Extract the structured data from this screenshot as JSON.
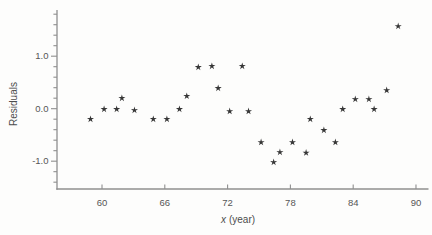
{
  "labels": {
    "xlabel_var": "x",
    "xlabel_rest": "(year)"
  },
  "chart_data": {
    "type": "scatter",
    "title": "",
    "xlabel": "x (year)",
    "ylabel": "Residuals",
    "marker": "asterisk-star",
    "marker_color": "#363636",
    "axis_color": "#8f8f8f",
    "grid": false,
    "legend": false,
    "xlim": [
      55.7,
      91.1
    ],
    "ylim": [
      -1.53,
      1.88
    ],
    "x_ticks": [
      60,
      66,
      72,
      78,
      84,
      90
    ],
    "x_tick_labels": [
      "60",
      "66",
      "72",
      "78",
      "84",
      "90"
    ],
    "y_ticks": [
      1.0,
      0.0,
      -1.0
    ],
    "y_tick_labels": [
      "1.0",
      "0.0",
      "-1.0"
    ],
    "y_minor_tick_step": 0.2,
    "y_minor_tick_range": [
      -1.4,
      1.8
    ],
    "points": [
      [
        58.9,
        -0.2
      ],
      [
        60.2,
        -0.01
      ],
      [
        61.4,
        -0.01
      ],
      [
        61.9,
        0.2
      ],
      [
        63.1,
        -0.03
      ],
      [
        64.9,
        -0.2
      ],
      [
        66.2,
        -0.2
      ],
      [
        67.4,
        -0.01
      ],
      [
        68.1,
        0.24
      ],
      [
        69.2,
        0.79
      ],
      [
        70.5,
        0.81
      ],
      [
        71.1,
        0.39
      ],
      [
        72.2,
        -0.05
      ],
      [
        73.4,
        0.81
      ],
      [
        74.0,
        -0.05
      ],
      [
        75.2,
        -0.64
      ],
      [
        76.4,
        -1.02
      ],
      [
        77.0,
        -0.83
      ],
      [
        78.2,
        -0.64
      ],
      [
        79.5,
        -0.84
      ],
      [
        79.9,
        -0.2
      ],
      [
        81.2,
        -0.41
      ],
      [
        82.3,
        -0.64
      ],
      [
        83.0,
        -0.01
      ],
      [
        84.2,
        0.18
      ],
      [
        85.5,
        0.18
      ],
      [
        86.0,
        -0.01
      ],
      [
        87.2,
        0.35
      ],
      [
        88.3,
        1.57
      ]
    ]
  }
}
